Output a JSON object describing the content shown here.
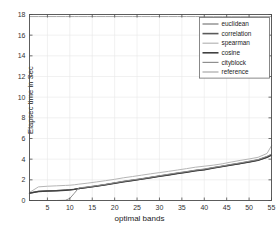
{
  "chart_data": {
    "type": "line",
    "title": "",
    "xlabel": "optimal bands",
    "ylabel": "Elapsec time in Sec",
    "xlim": [
      1,
      55
    ],
    "ylim": [
      0,
      18
    ],
    "xticks": [
      5,
      10,
      15,
      20,
      25,
      30,
      35,
      40,
      45,
      50,
      55
    ],
    "yticks": [
      0,
      2,
      4,
      6,
      8,
      10,
      12,
      14,
      16,
      18
    ],
    "grid": true,
    "legend_position": "top-right",
    "x": [
      1,
      3,
      5,
      7,
      9,
      10,
      11,
      12,
      14,
      16,
      18,
      20,
      22,
      24,
      26,
      28,
      30,
      32,
      34,
      36,
      38,
      40,
      42,
      44,
      46,
      48,
      50,
      52,
      54,
      55
    ],
    "series": [
      {
        "name": "euclidean",
        "color": "#7a7a7a",
        "values": [
          0.75,
          0.9,
          0.93,
          0.97,
          1.02,
          1.05,
          1.1,
          1.18,
          1.3,
          1.42,
          1.55,
          1.7,
          1.85,
          1.98,
          2.1,
          2.25,
          2.38,
          2.52,
          2.65,
          2.78,
          2.92,
          3.02,
          3.18,
          3.32,
          3.48,
          3.62,
          3.78,
          3.95,
          4.25,
          4.45
        ]
      },
      {
        "name": "correlation",
        "color": "#5a5a5a",
        "values": [
          0.7,
          0.88,
          0.92,
          0.95,
          1.0,
          1.03,
          1.08,
          1.16,
          1.28,
          1.4,
          1.53,
          1.68,
          1.82,
          1.95,
          2.08,
          2.22,
          2.35,
          2.48,
          2.62,
          2.75,
          2.88,
          2.98,
          3.15,
          3.3,
          3.45,
          3.58,
          3.74,
          3.9,
          4.2,
          4.4
        ]
      },
      {
        "name": "spearman",
        "color": "#b5b5b5",
        "values": [
          0.78,
          1.32,
          1.38,
          1.42,
          1.46,
          1.48,
          1.52,
          1.58,
          1.68,
          1.8,
          1.92,
          2.05,
          2.2,
          2.32,
          2.45,
          2.58,
          2.7,
          2.82,
          2.95,
          3.08,
          3.22,
          3.32,
          3.42,
          3.55,
          3.72,
          3.88,
          4.02,
          4.18,
          4.55,
          5.3
        ]
      },
      {
        "name": "cosine",
        "color": "#404040",
        "values": [
          0.72,
          0.86,
          0.9,
          0.94,
          0.99,
          1.02,
          1.07,
          1.15,
          1.26,
          1.38,
          1.51,
          1.66,
          1.8,
          1.93,
          2.06,
          2.2,
          2.33,
          2.46,
          2.6,
          2.73,
          2.86,
          2.96,
          3.12,
          3.28,
          3.42,
          3.56,
          3.72,
          3.88,
          4.18,
          4.38
        ]
      },
      {
        "name": "cityblock",
        "color": "#8f8f8f",
        "values": [
          0.0,
          0.0,
          0.0,
          0.0,
          0.02,
          0.2,
          0.7,
          1.22,
          1.32,
          1.44,
          1.57,
          1.72,
          1.87,
          2.0,
          2.12,
          2.26,
          2.4,
          2.54,
          2.68,
          2.8,
          2.94,
          3.05,
          3.2,
          3.34,
          3.5,
          3.64,
          3.8,
          3.96,
          4.28,
          4.5
        ]
      },
      {
        "name": "reference",
        "color": "#a8a8a8",
        "values": [
          17.8,
          17.8,
          17.8,
          17.8,
          17.8,
          17.8,
          17.8,
          17.8,
          17.8,
          17.8,
          17.8,
          17.8,
          17.8,
          17.8,
          17.8,
          17.8,
          17.8,
          17.8,
          17.8,
          17.8,
          17.8,
          17.8,
          17.8,
          17.8,
          17.8,
          17.8,
          17.8,
          17.8,
          17.8,
          17.8
        ]
      }
    ],
    "legend": [
      "euclidean",
      "correlation",
      "spearman",
      "cosine",
      "cityblock",
      "reference"
    ]
  },
  "axes": {
    "x_label": "optimal bands",
    "y_label": "Elapsec time in Sec"
  },
  "colors": {
    "axis": "#4d4d4d",
    "grid": "#e8e8e8",
    "legend_border": "#6b6b6b",
    "background": "#ffffff"
  }
}
